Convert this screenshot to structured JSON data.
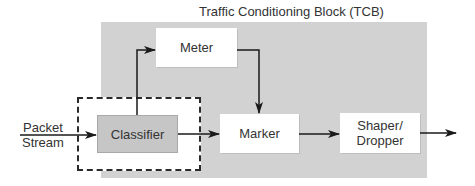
{
  "diagram": {
    "title": "Traffic Conditioning Block (TCB)",
    "input": {
      "line1": "Packet",
      "line2": "Stream"
    },
    "blocks": {
      "classifier": "Classifier",
      "meter": "Meter",
      "marker": "Marker",
      "shaper_line1": "Shaper/",
      "shaper_line2": "Dropper"
    },
    "edges": [
      {
        "from": "Packet Stream",
        "to": "Classifier"
      },
      {
        "from": "Classifier",
        "to": "Meter"
      },
      {
        "from": "Classifier",
        "to": "Marker"
      },
      {
        "from": "Meter",
        "to": "Marker"
      },
      {
        "from": "Marker",
        "to": "Shaper/Dropper"
      },
      {
        "from": "Shaper/Dropper",
        "to": "output"
      }
    ],
    "colors": {
      "tcb_background": "#d2d2d2",
      "classifier_fill": "#c6c6c6",
      "line": "#1a1a1a"
    }
  }
}
